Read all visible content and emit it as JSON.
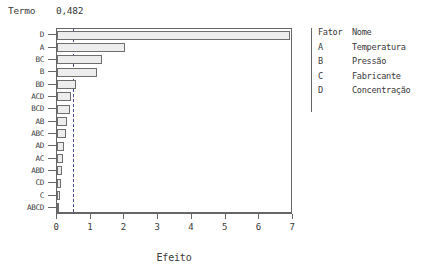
{
  "header": {
    "termo_label": "Termo",
    "termo_value": "0,482"
  },
  "legend": {
    "header": {
      "code": "Fator",
      "name": "Nome"
    },
    "rows": [
      {
        "code": "A",
        "name": "Temperatura"
      },
      {
        "code": "B",
        "name": "Pressão"
      },
      {
        "code": "C",
        "name": "Fabricante"
      },
      {
        "code": "D",
        "name": "Concentração"
      }
    ]
  },
  "chart_data": {
    "type": "bar",
    "orientation": "horizontal",
    "title": "",
    "xlabel": "Efeito",
    "ylabel": "Termo",
    "xlim": [
      0,
      7
    ],
    "xticks": [
      "0",
      "1",
      "2",
      "3",
      "4",
      "5",
      "6",
      "7"
    ],
    "grid": false,
    "legend_position": "right",
    "reference_line": {
      "label": "0,482",
      "value": 0.482,
      "style": "dashed",
      "color": "#4b4b8f"
    },
    "categories": [
      "D",
      "A",
      "BC",
      "B",
      "BD",
      "ACD",
      "BCD",
      "AB",
      "ABC",
      "AD",
      "AC",
      "ABD",
      "CD",
      "C",
      "ABCD"
    ],
    "values": [
      6.9,
      2.02,
      1.32,
      1.19,
      0.55,
      0.42,
      0.38,
      0.3,
      0.27,
      0.22,
      0.19,
      0.14,
      0.11,
      0.09,
      0.05
    ],
    "bar_fill": "#ededed",
    "bar_edge": "#6e6e6e"
  }
}
